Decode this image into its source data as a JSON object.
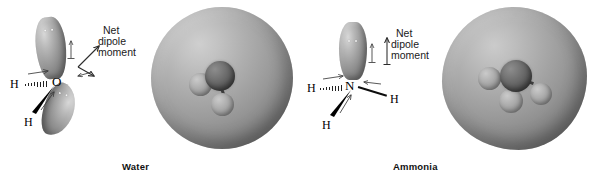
{
  "figure": {
    "type": "diagram",
    "style": "grayscale textbook illustration",
    "background_color": "#ffffff"
  },
  "panels": [
    {
      "id": "water",
      "caption": "Water",
      "formula_atoms": {
        "central_atom": "O",
        "hydrogen_left": "H",
        "hydrogen_bottom": "H"
      },
      "lone_pairs": 2,
      "lone_pair_dots_per_lobe": 2,
      "dipole_label_lines": [
        "Net",
        "dipole",
        "moment"
      ],
      "net_dipole_direction": "up-right diagonal",
      "bond_dipole_arrows": 4,
      "density_model": {
        "surface_shape": "sphere",
        "central_atom_visible": true,
        "hydrogens_visible": 2,
        "surface_color_light": "#cfcfcf",
        "surface_color_dark": "#636363"
      }
    },
    {
      "id": "ammonia",
      "caption": "Ammonia",
      "formula_atoms": {
        "central_atom": "N",
        "hydrogen_left": "H",
        "hydrogen_right": "H",
        "hydrogen_bottom": "H"
      },
      "lone_pairs": 1,
      "lone_pair_dots_per_lobe": 2,
      "dipole_label_lines": [
        "Net",
        "dipole",
        "moment"
      ],
      "net_dipole_direction": "straight up",
      "bond_dipole_arrows": 3,
      "density_model": {
        "surface_shape": "rounded blob",
        "central_atom_visible": true,
        "hydrogens_visible": 3,
        "surface_color_light": "#cbcbcb",
        "surface_color_dark": "#606060"
      }
    }
  ],
  "colors": {
    "lobe_light": "#d8d8d8",
    "lobe_dark": "#6a6a6a",
    "bond_black": "#000000",
    "text": "#111111"
  }
}
